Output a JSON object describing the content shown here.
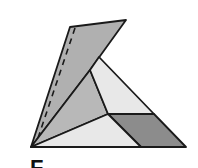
{
  "diagram": {
    "label": "F",
    "colors": {
      "stroke": "#1a1a1a",
      "flap": "#b0b0b0",
      "middle": "#b8b8b8",
      "light": "#e8e8e8",
      "dark": "#8c8c8c"
    },
    "vertices": {
      "bottom_left": [
        31,
        147
      ],
      "bottom_right": [
        186,
        147
      ],
      "flap_top_left": [
        70,
        27
      ],
      "flap_top_right": [
        126,
        20
      ],
      "triangle_apex": [
        99,
        57
      ],
      "fold_inner": [
        90,
        70
      ],
      "center": [
        108,
        114
      ],
      "right_mid": [
        154,
        114
      ],
      "bottom_mid": [
        141,
        147
      ]
    },
    "faces": [
      {
        "name": "folded-flap",
        "fill": "flap",
        "points": "31,147 70,27 126,20 90,70"
      },
      {
        "name": "middle-region",
        "fill": "middle",
        "points": "31,147 90,70 108,114"
      },
      {
        "name": "upper-light-region",
        "fill": "light",
        "points": "90,70 99,57 154,114 108,114"
      },
      {
        "name": "dark-parallelogram",
        "fill": "dark",
        "points": "108,114 154,114 186,147 141,147"
      },
      {
        "name": "lower-light-triangle",
        "fill": "light",
        "points": "31,147 108,114 141,147"
      }
    ],
    "dashed_fold_line": {
      "x1": 75,
      "y1": 28,
      "x2": 37,
      "y2": 141
    }
  }
}
